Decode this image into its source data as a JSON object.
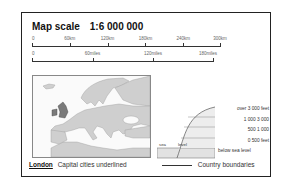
{
  "title": {
    "label": "Map scale",
    "ratio": "1:6 000 000"
  },
  "scale_km": {
    "labels": [
      "0",
      "60km",
      "120km",
      "180km",
      "240km",
      "300km"
    ]
  },
  "scale_miles": {
    "labels": [
      "0",
      "60miles",
      "120miles",
      "180miles"
    ]
  },
  "elevation_key": {
    "bands": [
      "over 3 000 feet",
      "1 000  3 000",
      "500  1 000",
      "0  500 feet",
      "below sea level"
    ],
    "sea_label": "sea",
    "level_label": "level",
    "colors": {
      "band_fill": "#e6e6e6",
      "band_fill_alt": "#f0f0f0",
      "line": "#555555"
    }
  },
  "map": {
    "land_color": "#cfcfcf",
    "sea_color": "#fafafa",
    "highlight_color": "#7a7a7a"
  },
  "legend": {
    "capital_example": "London",
    "capital_text": "Capital cities underlined",
    "boundary_text": "Country boundaries"
  }
}
